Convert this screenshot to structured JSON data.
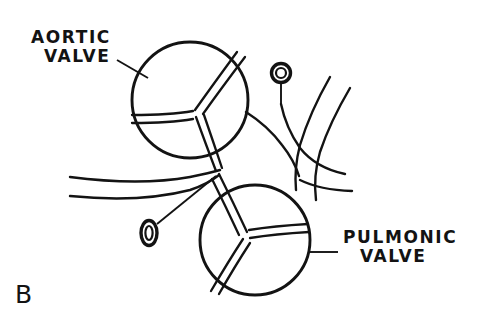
{
  "figure": {
    "panel_letter": "B",
    "background_color": "#ffffff",
    "ink_color": "#131313",
    "width": 477,
    "height": 323
  },
  "labels": {
    "aortic": {
      "line1": "AORTIC",
      "line2": "VALVE",
      "full": "AORTIC VALVE"
    },
    "pulmonic": {
      "line1": "PULMONIC",
      "line2": "VALVE",
      "full": "PULMONIC VALVE"
    }
  },
  "structures": {
    "aortic_valve": {
      "name": "aortic-valve",
      "center_x": 190,
      "center_y": 100,
      "radius": 58,
      "leaflet_count": 3
    },
    "pulmonic_valve": {
      "name": "pulmonic-valve",
      "center_x": 255,
      "center_y": 240,
      "radius": 55,
      "leaflet_count": 3
    },
    "coronary_ostium_upper": {
      "name": "coronary-ostium-upper",
      "center_x": 281,
      "center_y": 73,
      "shape": "circle"
    },
    "coronary_ostium_lower": {
      "name": "coronary-ostium-lower",
      "center_x": 149,
      "center_y": 233,
      "shape": "ellipse"
    }
  }
}
